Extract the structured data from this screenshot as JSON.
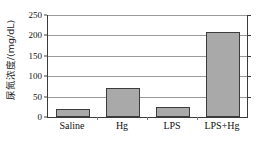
{
  "chart_data": {
    "type": "bar",
    "title": "",
    "subtitle": "",
    "xlabel": "",
    "ylabel": "尿氮浓度/(mg/dL)",
    "categories": [
      "Saline",
      "Hg",
      "LPS",
      "LPS+Hg"
    ],
    "values": [
      20,
      70,
      25,
      208
    ],
    "series": [
      {
        "name": "尿氮浓度",
        "values": [
          20,
          70,
          25,
          208
        ]
      }
    ],
    "ylim": [
      0,
      250
    ],
    "ytick_labels": [
      "0",
      "50",
      "100",
      "150",
      "200",
      "250"
    ],
    "ytick_values": [
      0,
      50,
      100,
      150,
      200,
      250
    ],
    "grid": "horizontal",
    "legend": "none",
    "bar_fill_color": "#a9a9a9",
    "bar_edge_color": "#3c3c3c",
    "axis_color": "#3a3a3a",
    "grid_color": "#9a9a9a",
    "background_color": "#ffffff"
  }
}
